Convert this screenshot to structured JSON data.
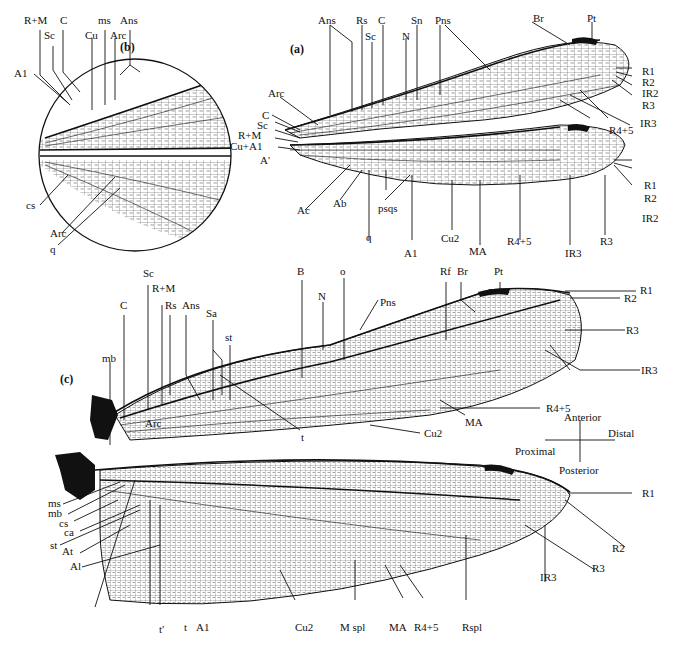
{
  "figure": {
    "panels": {
      "a": {
        "label": "(a)",
        "forewing_labels": [
          "Ans",
          "Rs",
          "Sc",
          "C",
          "N",
          "Sn",
          "Pns",
          "Br",
          "Pt",
          "R1",
          "R2",
          "IR2",
          "R3",
          "IR3",
          "R4+5",
          "Arc",
          "C",
          "Sc",
          "R+M",
          "Cu+A1",
          "A'"
        ],
        "hindwing_labels": [
          "Ac",
          "Ab",
          "q",
          "psqs",
          "A1",
          "Cu2",
          "MA",
          "R4+5",
          "IR3",
          "R3",
          "IR2",
          "R2",
          "R1"
        ]
      },
      "b": {
        "label": "(b)",
        "labels": [
          "R+M",
          "C",
          "Sc",
          "A1",
          "Cu",
          "ms",
          "Arc",
          "Ans",
          "cs",
          "Arc",
          "q"
        ]
      },
      "c": {
        "label": "(c)",
        "forewing_labels": [
          "Sc",
          "C",
          "R+M",
          "Rs",
          "Ans",
          "Sa",
          "st",
          "mb",
          "Arc",
          "B",
          "N",
          "o",
          "Pns",
          "Rf",
          "Br",
          "Pt",
          "R1",
          "R2",
          "R3",
          "IR3",
          "R4+5",
          "MA",
          "Cu2",
          "t"
        ],
        "hindwing_labels": [
          "ms",
          "mb",
          "cs",
          "ca",
          "st",
          "At",
          "Al",
          "t'",
          "t",
          "A1",
          "Cu2",
          "M spl",
          "MA",
          "R4+5",
          "Rspl",
          "IR3",
          "R3",
          "R2",
          "R1"
        ],
        "orientation": {
          "anterior": "Anterior",
          "posterior": "Posterior",
          "proximal": "Proximal",
          "distal": "Distal"
        }
      }
    }
  },
  "labels": {
    "b_RM": "R+M",
    "b_C": "C",
    "b_Sc": "Sc",
    "b_A1": "A1",
    "b_Cu": "Cu",
    "b_ms": "ms",
    "b_Arc": "Arc",
    "b_Ans": "Ans",
    "b_cs": "cs",
    "b_Arc2": "Arc",
    "b_q": "q",
    "a_Ans": "Ans",
    "a_Rs": "Rs",
    "a_C": "C",
    "a_Sc": "Sc",
    "a_N": "N",
    "a_Sn": "Sn",
    "a_Pns": "Pns",
    "a_Br": "Br",
    "a_Pt": "Pt",
    "a_R1": "R1",
    "a_R2": "R2",
    "a_IR2": "IR2",
    "a_R3": "R3",
    "a_IR3": "IR3",
    "a_R45": "R4+5",
    "a_Arc": "Arc",
    "a_C2": "C",
    "a_Sc2": "Sc",
    "a_RM": "R+M",
    "a_CuA1": "Cu+A1",
    "a_Ap": "A'",
    "a_Ac": "Ac",
    "a_Ab": "Ab",
    "a_q": "q",
    "a_psqs": "psqs",
    "a_A1": "A1",
    "a_Cu2": "Cu2",
    "a_MA": "MA",
    "a_hR45": "R4+5",
    "a_hIR3": "IR3",
    "a_hR3": "R3",
    "a_hIR2": "IR2",
    "a_hR2": "R2",
    "a_hR1": "R1",
    "c_Sc": "Sc",
    "c_C": "C",
    "c_RM": "R+M",
    "c_Rs": "Rs",
    "c_Ans": "Ans",
    "c_Sa": "Sa",
    "c_st": "st",
    "c_mb": "mb",
    "c_Arc": "Arc",
    "c_B": "B",
    "c_N": "N",
    "c_o": "o",
    "c_Pns": "Pns",
    "c_Rf": "Rf",
    "c_Br": "Br",
    "c_Pt": "Pt",
    "c_R1": "R1",
    "c_R2": "R2",
    "c_R3": "R3",
    "c_IR3": "IR3",
    "c_R45": "R4+5",
    "c_MA": "MA",
    "c_Cu2": "Cu2",
    "c_t": "t",
    "c_ms": "ms",
    "c_mb2": "mb",
    "c_cs": "cs",
    "c_ca": "ca",
    "c_st2": "st",
    "c_At": "At",
    "c_Al": "Al",
    "c_tp": "t′",
    "c_t2": "t",
    "c_A1": "A1",
    "c_hCu2": "Cu2",
    "c_Mspl": "M spl",
    "c_hMA": "MA",
    "c_hR45": "R4+5",
    "c_Rspl": "Rspl",
    "c_hIR3": "IR3",
    "c_hR3": "R3",
    "c_hR2": "R2",
    "c_hR1": "R1",
    "c_ant": "Anterior",
    "c_post": "Posterior",
    "c_prox": "Proximal",
    "c_dist": "Distal"
  }
}
